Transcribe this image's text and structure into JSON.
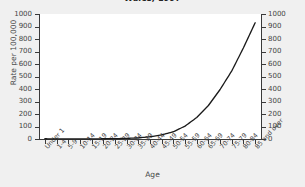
{
  "chart_data": {
    "type": "line",
    "title": "Wales, 1997",
    "xlabel": "Age",
    "ylabel": "Rate per 100,000",
    "ylabel_right": "Rate per 100,000",
    "ylim": [
      0,
      1000
    ],
    "ytick_step": 100,
    "yticks": [
      0,
      100,
      200,
      300,
      400,
      500,
      600,
      700,
      800,
      900,
      1000
    ],
    "grid": false,
    "legend": false,
    "line_color": "#1a1a1a",
    "categories": [
      "Under 1",
      "1-4",
      "5-9",
      "10-14",
      "15-19",
      "20-24",
      "25-29",
      "30-34",
      "35-39",
      "40-44",
      "45-49",
      "50-54",
      "55-59",
      "60-64",
      "65-69",
      "70-74",
      "75-79",
      "80-84",
      "85 and over"
    ],
    "values": [
      2,
      1,
      1,
      1,
      1,
      2,
      3,
      5,
      9,
      18,
      33,
      58,
      103,
      172,
      268,
      396,
      545,
      730,
      930
    ],
    "xlabel_rotation": -48
  }
}
